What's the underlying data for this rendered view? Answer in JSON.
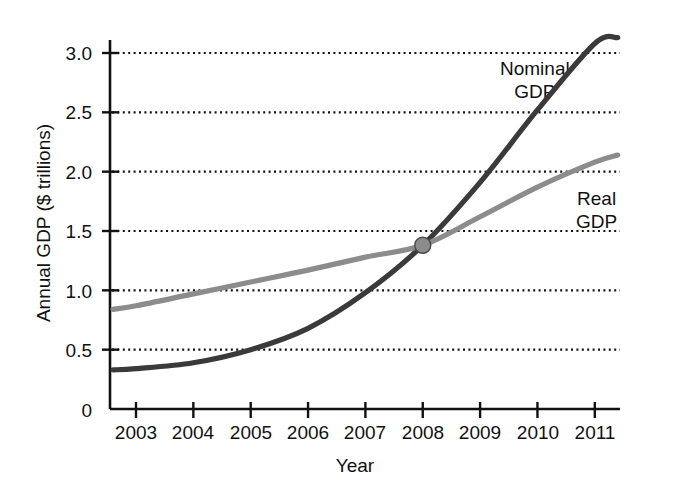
{
  "chart_data": {
    "type": "line",
    "title": "",
    "xlabel": "Year",
    "ylabel": "Annual GDP ($ trillions)",
    "xlim": [
      2002.6,
      2011.4
    ],
    "ylim": [
      0,
      3.25
    ],
    "xticks": [
      "2003",
      "2004",
      "2005",
      "2006",
      "2007",
      "2008",
      "2009",
      "2010",
      "2011"
    ],
    "yticks": [
      "0",
      "0.5",
      "1.0",
      "1.5",
      "2.0",
      "2.5",
      "3.0"
    ],
    "grid": "horizontal-dotted",
    "legend_position": "inline-annotations",
    "x": [
      2002.6,
      2003,
      2004,
      2005,
      2006,
      2007,
      2008,
      2009,
      2010,
      2011,
      2011.4
    ],
    "series": [
      {
        "name": "Nominal GDP",
        "color": "#3a3a3a",
        "values": [
          0.33,
          0.34,
          0.39,
          0.5,
          0.68,
          0.98,
          1.38,
          1.91,
          2.52,
          3.08,
          3.13
        ]
      },
      {
        "name": "Real GDP",
        "color": "#8c8c8c",
        "values": [
          0.84,
          0.87,
          0.97,
          1.07,
          1.17,
          1.28,
          1.38,
          1.62,
          1.87,
          2.08,
          2.14
        ]
      }
    ],
    "annotations": [
      {
        "name": "intersection-marker",
        "x": 2008,
        "y": 1.38,
        "color": "#8c8c8c",
        "edge_color": "#4a4a4a",
        "shape": "circle"
      }
    ],
    "series_labels": [
      {
        "name": "Nominal GDP",
        "text": "Nominal\nGDP"
      },
      {
        "name": "Real GDP",
        "text": "Real\nGDP"
      }
    ]
  },
  "axis": {
    "ylabel": "Annual GDP ($ trillions)",
    "xlabel": "Year"
  }
}
